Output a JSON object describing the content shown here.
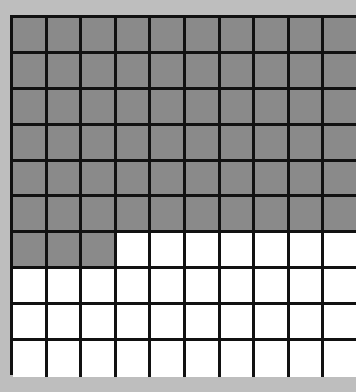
{
  "diagram": {
    "type": "hundred-grid",
    "rows": 10,
    "columns": 10,
    "total_cells": 100,
    "shaded_cells": 63,
    "unshaded_cells": 37,
    "shaded_full_rows": 6,
    "partial_row_shaded": 3,
    "colors": {
      "background": "#bebebe",
      "shaded": "#8a8a8a",
      "unshaded": "#ffffff",
      "grid_lines": "#111111"
    }
  }
}
